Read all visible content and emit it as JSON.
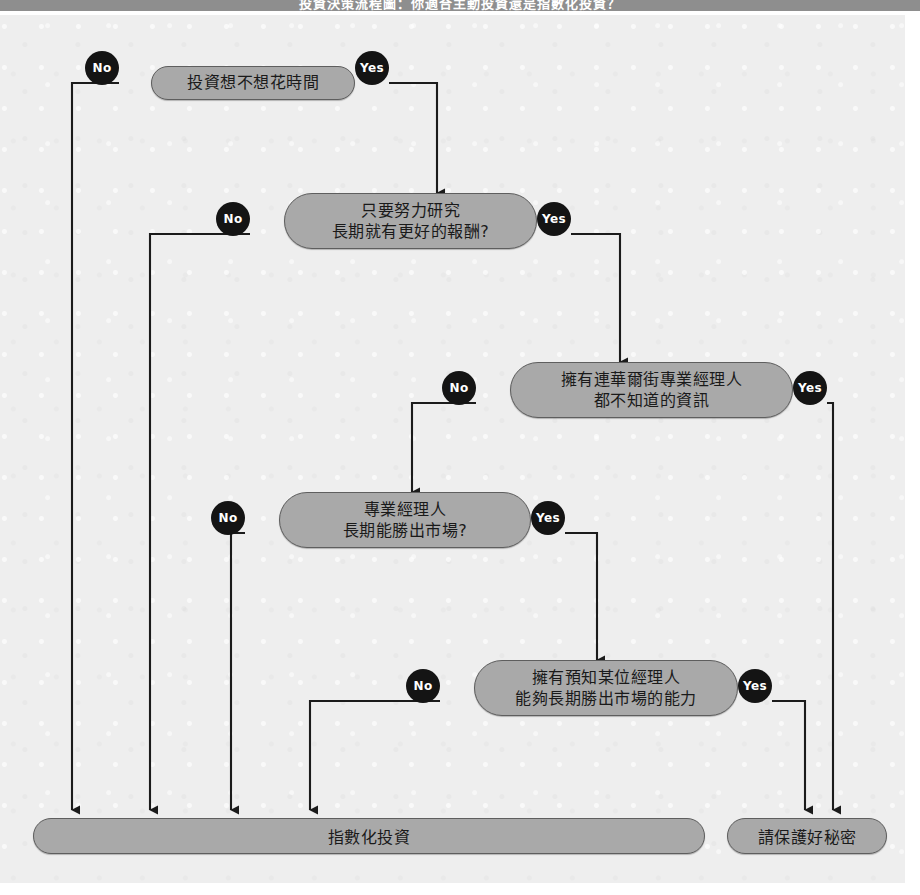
{
  "header": {
    "title": "投資決策流程圖：你適合主動投資還是指數化投資？"
  },
  "flowchart": {
    "type": "decision-tree",
    "yes_label": "Yes",
    "no_label": "No",
    "node_fill": "#a9a9a9",
    "node_stroke": "#5e5e5e",
    "badge_fill": "#141414",
    "badge_text": "#ffffff",
    "canvas_bg": "#eeeeee",
    "header_bg": "#8e8e8e",
    "decisions": [
      {
        "id": "d1",
        "text": "投資想不想花時間",
        "lines": 1,
        "no": "No",
        "yes": "Yes",
        "no_target": "指數化投資",
        "yes_target": "只要努力研究 長期就有更好的報酬?"
      },
      {
        "id": "d2",
        "text": "只要努力研究\n長期就有更好的報酬?",
        "lines": 2,
        "no": "No",
        "yes": "Yes",
        "no_target": "指數化投資",
        "yes_target": "擁有連華爾街專業經理人 都不知道的資訊"
      },
      {
        "id": "d3",
        "text": "擁有連華爾街專業經理人\n都不知道的資訊",
        "lines": 2,
        "no": "No",
        "yes": "Yes",
        "no_target": "專業經理人 長期能勝出市場?",
        "yes_target": "請保護好秘密"
      },
      {
        "id": "d4",
        "text": "專業經理人\n長期能勝出市場?",
        "lines": 2,
        "no": "No",
        "yes": "Yes",
        "no_target": "指數化投資",
        "yes_target": "擁有預知某位經理人 能夠長期勝出市場的能力"
      },
      {
        "id": "d5",
        "text": "擁有預知某位經理人\n能夠長期勝出市場的能力",
        "lines": 2,
        "no": "No",
        "yes": "Yes",
        "no_target": "指數化投資",
        "yes_target": "請保護好秘密"
      }
    ],
    "results": [
      {
        "id": "r1",
        "text": "指數化投資"
      },
      {
        "id": "r2",
        "text": "請保護好秘密"
      }
    ]
  }
}
